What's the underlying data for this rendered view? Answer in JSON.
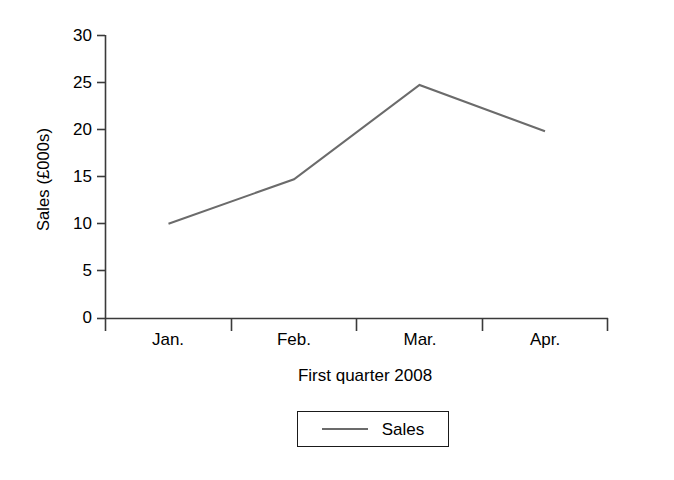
{
  "chart_data": {
    "type": "line",
    "title": "",
    "subtitle": "",
    "xlabel": "First quarter 2008",
    "ylabel": "Sales (£000s)",
    "categories": [
      "Jan.",
      "Feb.",
      "Mar.",
      "Apr."
    ],
    "values": [
      10.0,
      14.7,
      24.7,
      19.8
    ],
    "series": [
      {
        "name": "Sales",
        "values": [
          10.0,
          14.7,
          24.7,
          19.8
        ]
      }
    ],
    "ylim": [
      0,
      30
    ],
    "yticks": [
      0,
      5,
      10,
      15,
      20,
      25,
      30
    ],
    "ytick_labels": [
      "0",
      "5",
      "10",
      "15",
      "20",
      "25",
      "30"
    ],
    "grid": false,
    "legend": {
      "position": "bottom",
      "entries": [
        "Sales"
      ]
    },
    "colors": {
      "line": "#6b6b6b",
      "axis": "#3a3a3a",
      "text": "#000000",
      "background": "#ffffff",
      "legend_border": "#1a1a1a"
    }
  }
}
